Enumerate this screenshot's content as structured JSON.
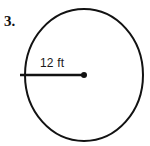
{
  "figure": {
    "problem_number": "3.",
    "radius_label": "12 ft",
    "shape_name": "circle",
    "colors": {
      "stroke": "#121212",
      "background": "#ffffff",
      "text": "#111111"
    },
    "geometry": {
      "circle_center_x": 84,
      "circle_center_y": 75,
      "circle_radius_x": 59,
      "circle_radius_y": 66,
      "stroke_width": 2,
      "radius_line_start_x": 20,
      "radius_line_start_y": 75,
      "radius_line_end_x": 84,
      "radius_line_end_y": 75,
      "radius_line_width": 2.6,
      "center_dot_radius": 3
    }
  }
}
